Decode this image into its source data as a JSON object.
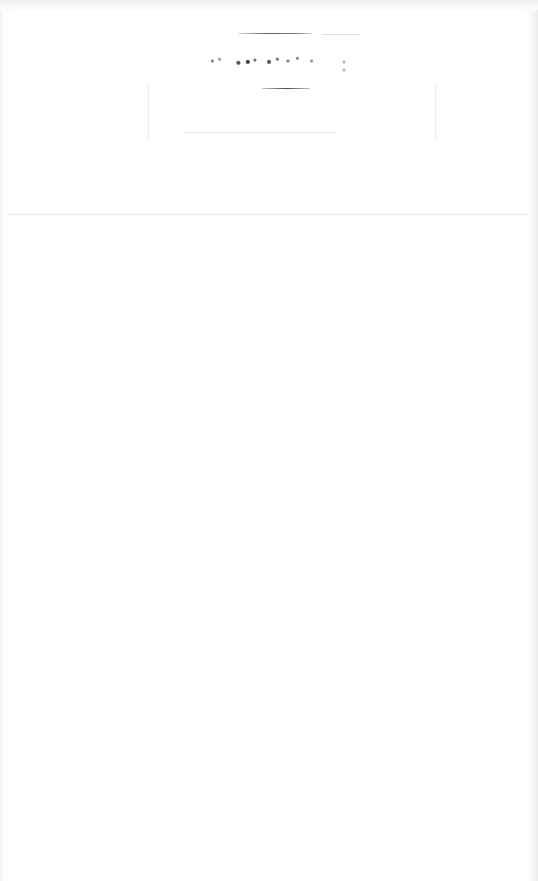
{
  "document": {
    "type": "scanned-page",
    "legible_text": [],
    "background_color": "#fdfdfd",
    "ink_color": "#282828"
  }
}
